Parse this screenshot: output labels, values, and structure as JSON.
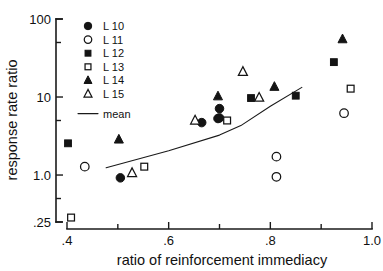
{
  "chart_data": {
    "type": "scatter",
    "title": "",
    "xlabel": "ratio of reinforcement immediacy",
    "ylabel": "response rate ratio",
    "xlim": [
      0.4,
      1.0
    ],
    "ylim": [
      0.25,
      100
    ],
    "yscale": "log",
    "xscale": "linear",
    "grid": false,
    "legend_position": "top-left inside",
    "x_ticks_major": [
      ".4",
      ".6",
      ".8",
      "1.0"
    ],
    "x_tick_major_values": [
      0.4,
      0.6,
      0.8,
      1.0
    ],
    "x_ticks_minor_values": [
      0.5,
      0.7,
      0.9
    ],
    "y_ticks_major": [
      "100",
      "10",
      "1.0",
      ".25"
    ],
    "y_tick_major_values": [
      100,
      10,
      1.0,
      0.25
    ],
    "y_ticks_minor_values": [
      50,
      5,
      0.5
    ],
    "series": [
      {
        "name": "L 10",
        "marker": "filled-circle",
        "color": "#141414",
        "points": [
          {
            "x": 0.505,
            "y": 0.92
          },
          {
            "x": 0.665,
            "y": 4.7
          },
          {
            "x": 0.697,
            "y": 5.3
          },
          {
            "x": 0.7,
            "y": 7.1
          },
          {
            "x": 0.7,
            "y": 5.4
          }
        ]
      },
      {
        "name": "L 11",
        "marker": "open-circle",
        "color": "#141414",
        "points": [
          {
            "x": 0.435,
            "y": 1.28
          },
          {
            "x": 0.812,
            "y": 0.95
          },
          {
            "x": 0.812,
            "y": 1.72
          },
          {
            "x": 0.945,
            "y": 6.2
          }
        ]
      },
      {
        "name": "L 12",
        "marker": "filled-square",
        "color": "#141414",
        "points": [
          {
            "x": 0.402,
            "y": 2.55
          },
          {
            "x": 0.762,
            "y": 9.7
          },
          {
            "x": 0.85,
            "y": 10.4
          },
          {
            "x": 0.925,
            "y": 28.0
          }
        ]
      },
      {
        "name": "L 13",
        "marker": "open-square",
        "color": "#141414",
        "points": [
          {
            "x": 0.408,
            "y": 0.285
          },
          {
            "x": 0.552,
            "y": 1.28
          },
          {
            "x": 0.715,
            "y": 5.0
          },
          {
            "x": 0.958,
            "y": 12.8
          }
        ]
      },
      {
        "name": "L 14",
        "marker": "filled-triangle",
        "color": "#141414",
        "points": [
          {
            "x": 0.502,
            "y": 2.85
          },
          {
            "x": 0.697,
            "y": 10.2
          },
          {
            "x": 0.808,
            "y": 13.5
          },
          {
            "x": 0.942,
            "y": 55.0
          }
        ]
      },
      {
        "name": "L 15",
        "marker": "open-triangle",
        "color": "#141414",
        "points": [
          {
            "x": 0.528,
            "y": 1.06
          },
          {
            "x": 0.652,
            "y": 5.0
          },
          {
            "x": 0.746,
            "y": 21.0
          },
          {
            "x": 0.778,
            "y": 9.8
          }
        ]
      }
    ],
    "mean_line": {
      "name": "mean",
      "color": "#141414",
      "points": [
        {
          "x": 0.477,
          "y": 1.24
        },
        {
          "x": 0.6,
          "y": 2.05
        },
        {
          "x": 0.7,
          "y": 3.25
        },
        {
          "x": 0.742,
          "y": 4.3
        },
        {
          "x": 0.8,
          "y": 7.6
        },
        {
          "x": 0.862,
          "y": 13.3
        }
      ]
    },
    "legend_entries": [
      {
        "label": "L 10",
        "marker": "filled-circle"
      },
      {
        "label": "L 11",
        "marker": "open-circle"
      },
      {
        "label": "L 12",
        "marker": "filled-square"
      },
      {
        "label": "L 13",
        "marker": "open-square"
      },
      {
        "label": "L 14",
        "marker": "filled-triangle"
      },
      {
        "label": "L 15",
        "marker": "open-triangle"
      },
      {
        "label": "mean",
        "marker": "line"
      }
    ]
  }
}
